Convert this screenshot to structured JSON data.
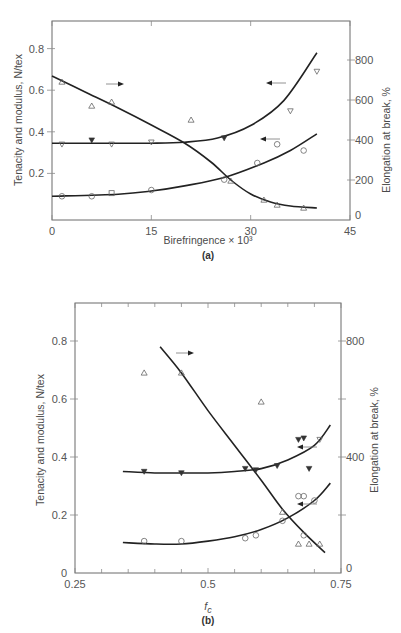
{
  "figure": {
    "panels": [
      "(a)",
      "(b)"
    ]
  },
  "chart_data": [
    {
      "type": "scatter",
      "panel_label": "(a)",
      "title": "",
      "xlabel": "Birefringence × 10³",
      "ylabel_left": "Tenacity and modulus, N/tex",
      "ylabel_right": "Elongation at break, %",
      "xlim": [
        0,
        45
      ],
      "ylim_left": [
        0,
        0.9
      ],
      "ylim_right": [
        0,
        900
      ],
      "x_ticks": [
        "0",
        "15",
        "30",
        "45"
      ],
      "y_ticks_left": [
        "0.2",
        "0.4",
        "0.6",
        "0.8"
      ],
      "y_ticks_right": [
        "0",
        "200",
        "400",
        "600",
        "800"
      ],
      "grid": false,
      "series": [
        {
          "name": "Elongation at break",
          "marker": "open-triangle-up",
          "axis": "right",
          "points": [
            [
              1.5,
              690
            ],
            [
              6,
              570
            ],
            [
              9,
              590
            ],
            [
              21,
              500
            ],
            [
              27,
              195
            ],
            [
              32,
              100
            ],
            [
              34,
              75
            ],
            [
              38,
              60
            ]
          ],
          "curve": [
            [
              0,
              720
            ],
            [
              5,
              640
            ],
            [
              10,
              560
            ],
            [
              15,
              475
            ],
            [
              20,
              385
            ],
            [
              24,
              290
            ],
            [
              27,
              200
            ],
            [
              30,
              130
            ],
            [
              33,
              90
            ],
            [
              36,
              70
            ],
            [
              40,
              60
            ]
          ]
        },
        {
          "name": "Modulus",
          "marker": "open-triangle-down / filled-triangle-down",
          "axis": "left",
          "points": [
            [
              1.5,
              0.34
            ],
            [
              6,
              0.36
            ],
            [
              9,
              0.34
            ],
            [
              15,
              0.35
            ],
            [
              26,
              0.37
            ],
            [
              36,
              0.5
            ],
            [
              40,
              0.69
            ]
          ],
          "curve": [
            [
              0,
              0.345
            ],
            [
              10,
              0.345
            ],
            [
              15,
              0.345
            ],
            [
              20,
              0.35
            ],
            [
              25,
              0.37
            ],
            [
              30,
              0.43
            ],
            [
              35,
              0.55
            ],
            [
              40,
              0.78
            ]
          ]
        },
        {
          "name": "Tenacity",
          "marker": "open-circle / open-square",
          "axis": "left",
          "points": [
            [
              1.5,
              0.09
            ],
            [
              6,
              0.09
            ],
            [
              9,
              0.105
            ],
            [
              15,
              0.12
            ],
            [
              26,
              0.17
            ],
            [
              31,
              0.25
            ],
            [
              34,
              0.34
            ],
            [
              38,
              0.31
            ]
          ],
          "curve": [
            [
              0,
              0.09
            ],
            [
              10,
              0.1
            ],
            [
              15,
              0.115
            ],
            [
              20,
              0.14
            ],
            [
              26,
              0.18
            ],
            [
              32,
              0.25
            ],
            [
              36,
              0.31
            ],
            [
              40,
              0.39
            ]
          ]
        }
      ],
      "annotations": [
        {
          "type": "arrow",
          "direction": "right",
          "near_series": "Elongation at break"
        },
        {
          "type": "arrow",
          "direction": "left",
          "near_series": "Modulus"
        },
        {
          "type": "arrow",
          "direction": "left",
          "near_series": "Tenacity"
        }
      ]
    },
    {
      "type": "scatter",
      "panel_label": "(b)",
      "title": "",
      "xlabel": "f_c",
      "ylabel_left": "Tenacity and modulus, N/tex",
      "ylabel_right": "Elongation at break, %",
      "xlim": [
        0.25,
        0.75
      ],
      "ylim_left": [
        0,
        0.9
      ],
      "ylim_right": [
        0,
        900
      ],
      "x_ticks": [
        "0.25",
        "0.5",
        "0.75"
      ],
      "y_ticks_left": [
        "0",
        "0.2",
        "0.4",
        "0.6",
        "0.8"
      ],
      "y_ticks_right": [
        "0",
        "400",
        "800"
      ],
      "grid": false,
      "series": [
        {
          "name": "Elongation at break",
          "marker": "open-triangle-up",
          "axis": "right",
          "points": [
            [
              0.38,
              690
            ],
            [
              0.45,
              690
            ],
            [
              0.6,
              590
            ],
            [
              0.64,
              210
            ],
            [
              0.67,
              100
            ],
            [
              0.69,
              100
            ],
            [
              0.71,
              100
            ]
          ],
          "curve": [
            [
              0.41,
              780
            ],
            [
              0.45,
              690
            ],
            [
              0.5,
              560
            ],
            [
              0.55,
              440
            ],
            [
              0.6,
              320
            ],
            [
              0.64,
              220
            ],
            [
              0.68,
              140
            ],
            [
              0.72,
              70
            ]
          ]
        },
        {
          "name": "Modulus",
          "marker": "filled-triangle-down / open-triangle-down",
          "axis": "left",
          "points": [
            [
              0.38,
              0.35
            ],
            [
              0.45,
              0.345
            ],
            [
              0.57,
              0.36
            ],
            [
              0.59,
              0.355
            ],
            [
              0.63,
              0.37
            ],
            [
              0.67,
              0.46
            ],
            [
              0.68,
              0.465
            ],
            [
              0.69,
              0.36
            ],
            [
              0.71,
              0.46
            ]
          ],
          "curve": [
            [
              0.34,
              0.35
            ],
            [
              0.4,
              0.345
            ],
            [
              0.45,
              0.345
            ],
            [
              0.5,
              0.345
            ],
            [
              0.55,
              0.35
            ],
            [
              0.6,
              0.36
            ],
            [
              0.65,
              0.39
            ],
            [
              0.7,
              0.44
            ],
            [
              0.73,
              0.51
            ]
          ]
        },
        {
          "name": "Tenacity",
          "marker": "open-circle",
          "axis": "left",
          "points": [
            [
              0.38,
              0.11
            ],
            [
              0.45,
              0.11
            ],
            [
              0.57,
              0.12
            ],
            [
              0.59,
              0.13
            ],
            [
              0.64,
              0.18
            ],
            [
              0.67,
              0.265
            ],
            [
              0.68,
              0.265
            ],
            [
              0.68,
              0.13
            ],
            [
              0.7,
              0.25
            ]
          ],
          "curve": [
            [
              0.34,
              0.105
            ],
            [
              0.4,
              0.1
            ],
            [
              0.45,
              0.1
            ],
            [
              0.5,
              0.11
            ],
            [
              0.55,
              0.125
            ],
            [
              0.6,
              0.15
            ],
            [
              0.65,
              0.19
            ],
            [
              0.7,
              0.25
            ],
            [
              0.73,
              0.31
            ]
          ]
        }
      ],
      "annotations": [
        {
          "type": "arrow",
          "direction": "right",
          "near_series": "Elongation at break"
        },
        {
          "type": "arrow",
          "direction": "left",
          "near_series": "Modulus"
        },
        {
          "type": "arrow",
          "direction": "left",
          "near_series": "Tenacity"
        }
      ]
    }
  ]
}
